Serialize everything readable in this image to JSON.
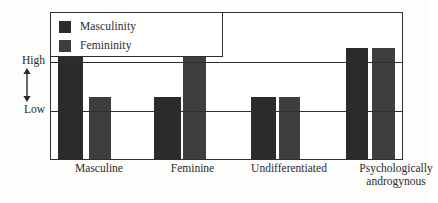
{
  "chart_data": {
    "type": "bar",
    "title": "",
    "subtitle": "",
    "xlabel": "",
    "ylabel": "",
    "categories": [
      "Masculine",
      "Feminine",
      "Undifferentiated",
      "Psychologically androgynous"
    ],
    "tick_labels_y": [
      "High",
      "Low"
    ],
    "y_axis_levels": {
      "high": "High",
      "low": "Low"
    },
    "ylim": [
      0,
      1
    ],
    "grid": true,
    "legend_position": "top-left",
    "series": [
      {
        "name": "Masculinity",
        "color": "#2b2b2b",
        "values": [
          1,
          0.5,
          0.5,
          1
        ],
        "value_labels": [
          "High",
          "Low",
          "Low",
          "High"
        ]
      },
      {
        "name": "Femininity",
        "color": "#3e3e3e",
        "values": [
          0.5,
          1,
          0.5,
          1
        ],
        "value_labels": [
          "Low",
          "High",
          "Low",
          "High"
        ]
      }
    ],
    "annotations": [
      "High",
      "Low"
    ]
  },
  "legend": {
    "items": [
      {
        "label": "Masculinity",
        "color": "#2b2b2b",
        "swatch_name": "legend-swatch-masculinity"
      },
      {
        "label": "Femininity",
        "color": "#3e3e3e",
        "swatch_name": "legend-swatch-femininity"
      }
    ]
  },
  "yaxis": {
    "high": "High",
    "low": "Low",
    "arrow_icon": "double-headed-vertical-arrow-icon"
  },
  "xaxis": {
    "ticks": [
      {
        "line1": "Masculine",
        "line2": ""
      },
      {
        "line1": "Feminine",
        "line2": ""
      },
      {
        "line1": "Undifferentiated",
        "line2": ""
      },
      {
        "line1": "Psychologically",
        "line2": "androgynous"
      }
    ]
  },
  "bars": [
    {
      "name": "bar-masculine-masculinity",
      "series": "Masculinity",
      "category": "Masculine",
      "level": "High",
      "left": 7,
      "width": 25,
      "height": 111,
      "color": "#2b2b2b"
    },
    {
      "name": "bar-masculine-femininity",
      "series": "Femininity",
      "category": "Masculine",
      "level": "Low",
      "left": 38,
      "width": 22,
      "height": 62,
      "color": "#3e3e3e"
    },
    {
      "name": "bar-feminine-masculinity",
      "series": "Masculinity",
      "category": "Feminine",
      "level": "Low",
      "left": 103,
      "width": 27,
      "height": 62,
      "color": "#2b2b2b"
    },
    {
      "name": "bar-feminine-femininity",
      "series": "Femininity",
      "category": "Feminine",
      "level": "High",
      "left": 132,
      "width": 23,
      "height": 111,
      "color": "#3e3e3e"
    },
    {
      "name": "bar-undifferentiated-masculinity",
      "series": "Masculinity",
      "category": "Undifferentiated",
      "level": "Low",
      "left": 200,
      "width": 25,
      "height": 62,
      "color": "#2b2b2b"
    },
    {
      "name": "bar-undifferentiated-femininity",
      "series": "Femininity",
      "category": "Undifferentiated",
      "level": "Low",
      "left": 228,
      "width": 21,
      "height": 62,
      "color": "#3e3e3e"
    },
    {
      "name": "bar-androgynous-masculinity",
      "series": "Masculinity",
      "category": "Psychologically androgynous",
      "level": "High",
      "left": 295,
      "width": 22,
      "height": 111,
      "color": "#2b2b2b"
    },
    {
      "name": "bar-androgynous-femininity",
      "series": "Femininity",
      "category": "Psychologically androgynous",
      "level": "High",
      "left": 321,
      "width": 23,
      "height": 111,
      "color": "#3e3e3e"
    }
  ],
  "tick_positions": [
    {
      "left": -6,
      "width": 110
    },
    {
      "left": 90,
      "width": 105
    },
    {
      "left": 174,
      "width": 130
    },
    {
      "left": 286,
      "width": 120
    }
  ]
}
